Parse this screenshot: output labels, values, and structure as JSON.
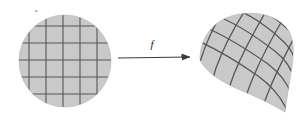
{
  "figure": {
    "kind": "math-diagram",
    "caption_text": "",
    "colors": {
      "background": "#ffffff",
      "region_fill": "#c9c9c9",
      "region_stroke": "#bdbdbd",
      "grid_line": "#575757",
      "arrow": "#3a3a3a",
      "label": "#1a1a1a"
    }
  },
  "source_region": {
    "name": "domain-disk",
    "shape": "circle",
    "center": [
      65,
      61
    ],
    "radius": 46,
    "grid": {
      "type": "rectilinear",
      "spacing": 17,
      "vertical_lines": [
        29,
        46,
        63,
        80,
        97
      ],
      "horizontal_lines": [
        26,
        43,
        60,
        77,
        94
      ],
      "line_width": 1.1
    }
  },
  "arrow": {
    "name": "mapping-arrow",
    "from": [
      118,
      58
    ],
    "to": [
      192,
      57
    ],
    "label": "f",
    "label_position": [
      152,
      45
    ],
    "head_length": 8,
    "head_width": 6
  },
  "target_region": {
    "name": "image-blob",
    "shape": "deformed-blob",
    "description": "curvilinear image of the disk under f",
    "outline_path": "M 200 60 C 200 36 215 18 240 14 C 262 11 280 18 288 30 C 294 39 294 52 292 66 C 290 80 287 95 285 112 C 272 104 255 96 238 89 C 220 81 206 72 200 60 Z",
    "grid": {
      "type": "curvilinear",
      "u_curves": 5,
      "v_curves": 5,
      "line_width": 1.3
    }
  }
}
